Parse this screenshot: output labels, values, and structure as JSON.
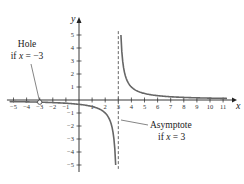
{
  "chart_data": {
    "type": "line",
    "title": "",
    "xlabel": "x",
    "ylabel": "y",
    "xlim": [
      -5.5,
      11.8
    ],
    "ylim": [
      -5.5,
      5.6
    ],
    "x_ticks": [
      -5,
      -4,
      -3,
      -2,
      -1,
      1,
      2,
      3,
      4,
      5,
      6,
      7,
      8,
      9,
      10,
      11
    ],
    "y_ticks": [
      -5,
      -4,
      -3,
      -2,
      -1,
      1,
      2,
      3,
      4,
      5
    ],
    "grid": false,
    "series": [
      {
        "name": "f(x) = 1/(x - 3), x ≠ -3",
        "function": "1/(x-3)",
        "domain_left": [
          -5.3,
          2.8
        ],
        "domain_right": [
          3.2,
          11.3
        ],
        "color": "#666666"
      }
    ],
    "asymptote": {
      "x": 3,
      "style": "dashed",
      "color": "#666666"
    },
    "hole": {
      "x": -3,
      "y": -0.1667
    },
    "annotations": [
      {
        "id": "hole",
        "lines": [
          "Hole",
          "if x = −3"
        ],
        "points_to": [
          -3,
          -0.1667
        ]
      },
      {
        "id": "asymptote",
        "lines": [
          "Asymptote",
          "if x = 3"
        ],
        "points_to": [
          3,
          -2.1
        ]
      }
    ]
  },
  "labels": {
    "x_axis": "x",
    "y_axis": "y",
    "hole_line1": "Hole",
    "hole_line2_pre": "if ",
    "hole_line2_var": "x",
    "hole_line2_post": " = −3",
    "asym_line1": "Asymptote",
    "asym_line2_pre": "if ",
    "asym_line2_var": "x",
    "asym_line2_post": " = 3"
  }
}
